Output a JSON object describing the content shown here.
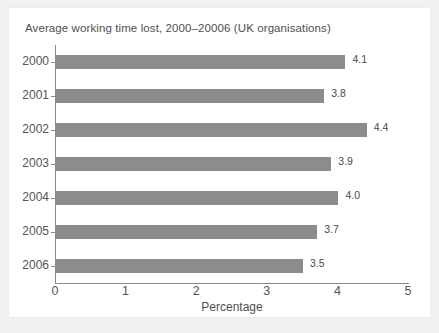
{
  "chart_data": {
    "type": "bar",
    "orientation": "horizontal",
    "title": "Average working time lost, 2000–20006 (UK organisations)",
    "categories": [
      "2000",
      "2001",
      "2002",
      "2003",
      "2004",
      "2005",
      "2006"
    ],
    "values": [
      4.1,
      3.8,
      4.4,
      3.9,
      4.0,
      3.7,
      3.5
    ],
    "value_labels": [
      "4.1",
      "3.8",
      "4.4",
      "3.9",
      "4.0",
      "3.7",
      "3.5"
    ],
    "xlabel": "Percentage",
    "ylabel": "",
    "xlim": [
      0,
      5
    ],
    "xticks": [
      0,
      1,
      2,
      3,
      4,
      5
    ],
    "xtick_labels": [
      "0",
      "1",
      "2",
      "3",
      "4",
      "5"
    ],
    "grid": false,
    "legend": false,
    "bar_color": "#8c8c8c",
    "axis_color": "#8a8a8a",
    "background_color": "#ffffff"
  }
}
